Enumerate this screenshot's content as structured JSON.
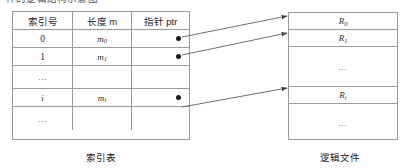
{
  "figure": {
    "clipped_top_text": "件的逻辑结构示意图",
    "index_table": {
      "headers": [
        "索引号",
        "长度 m",
        "指针 ptr"
      ],
      "rows": [
        {
          "index": "0",
          "length": "m",
          "length_sub": "0",
          "pointer": "dot"
        },
        {
          "index": "1",
          "length": "m",
          "length_sub": "1",
          "pointer": "dot"
        },
        {
          "index": "⋯",
          "length": "",
          "length_sub": "",
          "pointer": ""
        },
        {
          "index": "i",
          "length": "m",
          "length_sub": "i",
          "pointer": "dot"
        },
        {
          "index": "⋯",
          "length": "",
          "length_sub": "",
          "pointer": ""
        }
      ],
      "caption": "索引表"
    },
    "logical_file": {
      "rows": [
        {
          "label": "R",
          "sub": "0"
        },
        {
          "label": "R",
          "sub": "1"
        },
        {
          "label": "⋯",
          "sub": ""
        },
        {
          "label": "R",
          "sub": "i"
        },
        {
          "label": "⋯",
          "sub": ""
        }
      ],
      "caption": "逻辑文件"
    },
    "arrows": [
      {
        "from_row": "0",
        "to_row": "R0"
      },
      {
        "from_row": "1",
        "to_row": "R1"
      },
      {
        "from_row": "i",
        "to_row": "Ri"
      }
    ],
    "colors": {
      "line": "#9a9a9a",
      "arrow": "#3a3a3a",
      "dot": "#1a1a1a",
      "text": "#1c1c1c",
      "background": "#ffffff"
    }
  }
}
